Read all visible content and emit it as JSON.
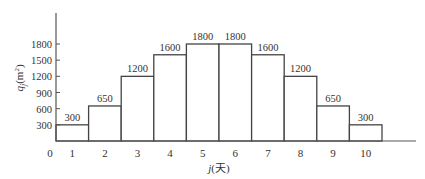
{
  "chart_data": {
    "type": "bar",
    "title": "",
    "xlabel": "j(天)",
    "ylabel": "q_j(m²)",
    "ylabel_main": "q",
    "ylabel_sub": "j",
    "ylabel_unit": "(m",
    "ylabel_sup": "2",
    "ylabel_close": ")",
    "xlabel_main": "j",
    "xlabel_unit": "(天)",
    "origin_label": "0",
    "categories": [
      "1",
      "2",
      "3",
      "4",
      "5",
      "6",
      "7",
      "8",
      "9",
      "10"
    ],
    "values": [
      300,
      650,
      1200,
      1600,
      1800,
      1800,
      1600,
      1200,
      650,
      300
    ],
    "data_labels": [
      "300",
      "650",
      "1200",
      "1600",
      "1800",
      "1800",
      "1600",
      "1200",
      "650",
      "300"
    ],
    "yticks": [
      300,
      600,
      900,
      1200,
      1500,
      1800
    ],
    "ytick_labels": [
      "300",
      "600",
      "900",
      "1200",
      "1500",
      "1800"
    ],
    "ylim": [
      0,
      2300
    ],
    "grid": false,
    "legend": null,
    "bar_style": "step histogram, white fill, dark outline, adjacent bars"
  }
}
